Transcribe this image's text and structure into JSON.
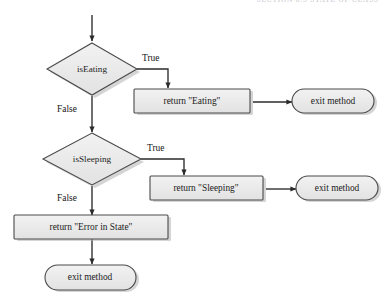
{
  "page": {
    "running_head": "SECTION 8.5    STATE OF CLASS",
    "background": "#ffffff"
  },
  "theme": {
    "shape_fill": "#e9e9e9",
    "shape_fill_light": "#efefef",
    "shape_stroke": "#4a4a4a",
    "shadow": "#b0b0b0",
    "connector": "#2b2b2b",
    "text": "#1d1d1d"
  },
  "flowchart": {
    "type": "flowchart",
    "title": "",
    "nodes": [
      {
        "id": "start",
        "kind": "entry",
        "label": ""
      },
      {
        "id": "isEating",
        "kind": "decision",
        "label": "isEating"
      },
      {
        "id": "retEating",
        "kind": "process",
        "label": "return \"Eating\""
      },
      {
        "id": "exitEating",
        "kind": "terminator",
        "label": "exit method"
      },
      {
        "id": "isSleeping",
        "kind": "decision",
        "label": "isSleeping"
      },
      {
        "id": "retSleeping",
        "kind": "process",
        "label": "return \"Sleeping\""
      },
      {
        "id": "exitSleeping",
        "kind": "terminator",
        "label": "exit method"
      },
      {
        "id": "retError",
        "kind": "process",
        "label": "return \"Error in State\""
      },
      {
        "id": "exitError",
        "kind": "terminator",
        "label": "exit method"
      }
    ],
    "edges": [
      {
        "from": "start",
        "to": "isEating",
        "label": ""
      },
      {
        "from": "isEating",
        "to": "retEating",
        "label": "True"
      },
      {
        "from": "isEating",
        "to": "isSleeping",
        "label": "False"
      },
      {
        "from": "retEating",
        "to": "exitEating",
        "label": ""
      },
      {
        "from": "isSleeping",
        "to": "retSleeping",
        "label": "True"
      },
      {
        "from": "isSleeping",
        "to": "retError",
        "label": "False"
      },
      {
        "from": "retSleeping",
        "to": "exitSleeping",
        "label": ""
      },
      {
        "from": "retError",
        "to": "exitError",
        "label": ""
      }
    ],
    "edge_labels": {
      "eating_true": "True",
      "eating_false": "False",
      "sleeping_true": "True",
      "sleeping_false": "False"
    }
  }
}
